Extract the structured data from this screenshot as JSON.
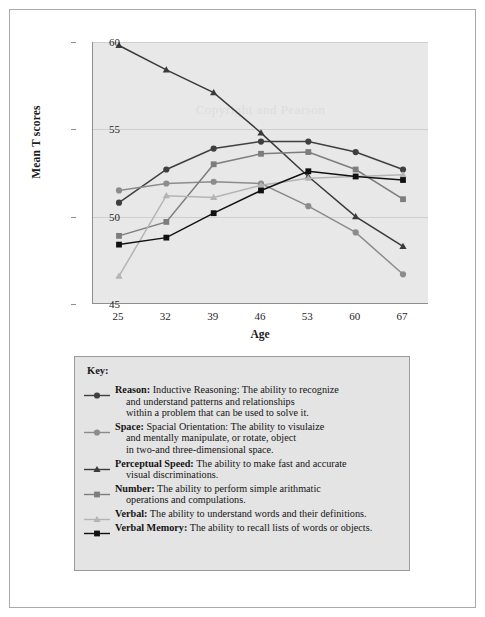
{
  "chart_data": {
    "type": "line",
    "title": "",
    "xlabel": "Age",
    "ylabel": "Mean T scores",
    "categories": [
      25,
      32,
      39,
      46,
      53,
      60,
      67
    ],
    "xtick_labels": [
      "25",
      "32",
      "39",
      "46",
      "53",
      "60",
      "67"
    ],
    "ytick_labels": [
      "45",
      "50",
      "55",
      "60"
    ],
    "yticks": [
      45,
      50,
      55,
      60
    ],
    "ylim": [
      45,
      60
    ],
    "grid": true,
    "legend_position": "below-plot",
    "watermark": "Copyright and Pearson",
    "series": [
      {
        "name": "Reason",
        "marker": "circle",
        "color": "#3f3f3f",
        "values": [
          50.8,
          52.7,
          53.9,
          54.3,
          54.3,
          53.7,
          52.7
        ]
      },
      {
        "name": "Space",
        "marker": "circle",
        "color": "#8c8c8c",
        "values": [
          51.5,
          51.9,
          52.0,
          51.9,
          50.6,
          49.1,
          46.7
        ]
      },
      {
        "name": "Perceptual Speed",
        "marker": "triangle",
        "color": "#3a3a3a",
        "values": [
          59.8,
          58.4,
          57.1,
          54.8,
          52.3,
          50.0,
          48.3
        ]
      },
      {
        "name": "Number",
        "marker": "square",
        "color": "#7d7d7d",
        "values": [
          48.9,
          49.7,
          53.0,
          53.6,
          53.7,
          52.7,
          51.0
        ]
      },
      {
        "name": "Verbal",
        "marker": "triangle",
        "color": "#b4b4b4",
        "values": [
          46.6,
          51.2,
          51.1,
          51.8,
          52.2,
          52.3,
          52.4
        ]
      },
      {
        "name": "Verbal Memory",
        "marker": "square",
        "color": "#111111",
        "values": [
          48.4,
          48.8,
          50.2,
          51.5,
          52.6,
          52.3,
          52.1
        ]
      }
    ]
  },
  "key": {
    "title": "Key:",
    "entries": [
      {
        "marker": "circle",
        "color": "#3f3f3f",
        "name": "Reason",
        "label": "Reason",
        "desc_first": "Inductive Reasoning: The ability to recognize",
        "desc_rest": [
          "and understand patterns and relationships",
          "within a problem that can be used to solve it."
        ]
      },
      {
        "marker": "circle",
        "color": "#8c8c8c",
        "name": "Space",
        "label": "Space",
        "desc_first": "Spacial Orientation: The ability to visulaize",
        "desc_rest": [
          "and mentally manipulate, or rotate, object",
          "in two-and three-dimensional space."
        ]
      },
      {
        "marker": "triangle",
        "color": "#3a3a3a",
        "name": "Perceptual Speed",
        "label": "Perceptual Speed",
        "desc_first": "The ability to make fast and accurate",
        "desc_rest": [
          "visual discriminations."
        ]
      },
      {
        "marker": "square",
        "color": "#7d7d7d",
        "name": "Number",
        "label": "Number",
        "desc_first": "The ability to perform simple arithmatic",
        "desc_rest": [
          "operations and compulations."
        ]
      },
      {
        "marker": "triangle",
        "color": "#b4b4b4",
        "name": "Verbal",
        "label": "Verbal",
        "desc_first": "The ability to understand words and their definitions.",
        "desc_rest": []
      },
      {
        "marker": "square",
        "color": "#111111",
        "name": "Verbal Memory",
        "label": "Verbal Memory",
        "desc_first": "The ability to recall lists of words or objects.",
        "desc_rest": []
      }
    ]
  }
}
